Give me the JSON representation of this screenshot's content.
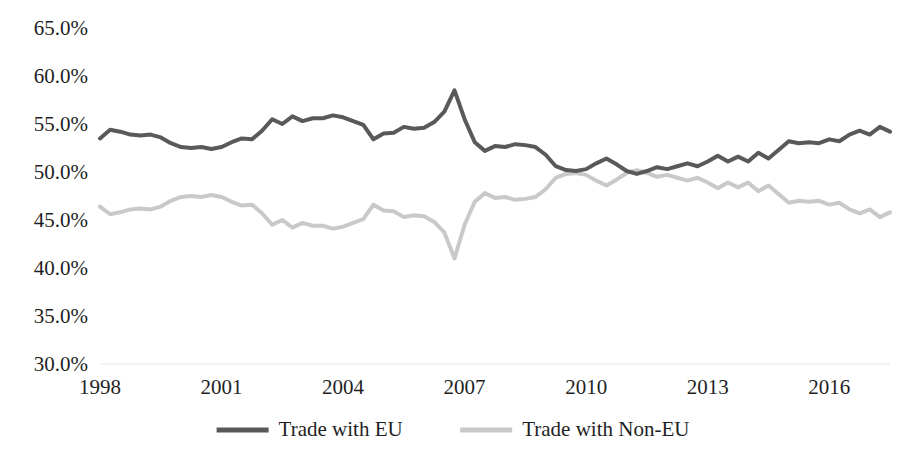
{
  "chart_data": {
    "type": "line",
    "title": "",
    "xlabel": "",
    "ylabel": "",
    "xlim": [
      1998.0,
      2017.5
    ],
    "ylim": [
      30.0,
      65.0
    ],
    "ytick_values": [
      65.0,
      60.0,
      55.0,
      50.0,
      45.0,
      40.0,
      35.0,
      30.0
    ],
    "ytick_labels": [
      "65.0%",
      "60.0%",
      "55.0%",
      "50.0%",
      "45.0%",
      "40.0%",
      "35.0%",
      "30.0%"
    ],
    "xtick_values": [
      1998,
      2001,
      2004,
      2007,
      2010,
      2013,
      2016
    ],
    "xtick_labels": [
      "1998",
      "2001",
      "2004",
      "2007",
      "2010",
      "2013",
      "2016"
    ],
    "grid": "baseline-only",
    "gridline_color": "#e8e8e8",
    "legend_position": "bottom",
    "value_unit": "%",
    "x": [
      1998.0,
      1998.25,
      1998.5,
      1998.75,
      1999.0,
      1999.25,
      1999.5,
      1999.75,
      2000.0,
      2000.25,
      2000.5,
      2000.75,
      2001.0,
      2001.25,
      2001.5,
      2001.75,
      2002.0,
      2002.25,
      2002.5,
      2002.75,
      2003.0,
      2003.25,
      2003.5,
      2003.75,
      2004.0,
      2004.25,
      2004.5,
      2004.75,
      2005.0,
      2005.25,
      2005.5,
      2005.75,
      2006.0,
      2006.25,
      2006.5,
      2006.75,
      2007.0,
      2007.25,
      2007.5,
      2007.75,
      2008.0,
      2008.25,
      2008.5,
      2008.75,
      2009.0,
      2009.25,
      2009.5,
      2009.75,
      2010.0,
      2010.25,
      2010.5,
      2010.75,
      2011.0,
      2011.25,
      2011.5,
      2011.75,
      2012.0,
      2012.25,
      2012.5,
      2012.75,
      2013.0,
      2013.25,
      2013.5,
      2013.75,
      2014.0,
      2014.25,
      2014.5,
      2014.75,
      2015.0,
      2015.25,
      2015.5,
      2015.75,
      2016.0,
      2016.25,
      2016.5,
      2016.75,
      2017.0,
      2017.25,
      2017.5
    ],
    "series": [
      {
        "name": "Trade with EU",
        "color": "#595959",
        "stroke_width": 4,
        "values": [
          53.5,
          54.4,
          54.2,
          53.9,
          53.8,
          53.9,
          53.6,
          53.0,
          52.6,
          52.5,
          52.6,
          52.4,
          52.6,
          53.1,
          53.5,
          53.4,
          54.3,
          55.5,
          55.0,
          55.8,
          55.3,
          55.6,
          55.6,
          55.9,
          55.7,
          55.3,
          54.9,
          53.4,
          54.0,
          54.1,
          54.7,
          54.5,
          54.6,
          55.2,
          56.3,
          58.5,
          55.5,
          53.1,
          52.2,
          52.7,
          52.6,
          52.9,
          52.8,
          52.6,
          51.8,
          50.6,
          50.2,
          50.1,
          50.3,
          50.9,
          51.4,
          50.8,
          50.1,
          49.8,
          50.1,
          50.5,
          50.3,
          50.6,
          50.9,
          50.6,
          51.1,
          51.7,
          51.1,
          51.6,
          51.1,
          52.0,
          51.4,
          52.3,
          53.2,
          53.0,
          53.1,
          53.0,
          53.4,
          53.2,
          53.9,
          54.3,
          53.9,
          54.7,
          54.2
        ]
      },
      {
        "name": "Trade with Non-EU",
        "color": "#c9c9c9",
        "stroke_width": 4,
        "values": [
          46.4,
          45.6,
          45.8,
          46.1,
          46.2,
          46.1,
          46.4,
          47.0,
          47.4,
          47.5,
          47.4,
          47.6,
          47.4,
          46.9,
          46.5,
          46.6,
          45.7,
          44.5,
          45.0,
          44.2,
          44.7,
          44.4,
          44.4,
          44.1,
          44.3,
          44.7,
          45.1,
          46.6,
          46.0,
          45.9,
          45.3,
          45.5,
          45.4,
          44.8,
          43.7,
          41.0,
          44.5,
          46.9,
          47.8,
          47.3,
          47.4,
          47.1,
          47.2,
          47.4,
          48.2,
          49.4,
          49.8,
          49.9,
          49.7,
          49.1,
          48.6,
          49.2,
          49.9,
          50.2,
          49.9,
          49.5,
          49.7,
          49.4,
          49.1,
          49.4,
          48.9,
          48.3,
          48.9,
          48.4,
          48.9,
          48.0,
          48.6,
          47.7,
          46.8,
          47.0,
          46.9,
          47.0,
          46.6,
          46.8,
          46.1,
          45.7,
          46.1,
          45.3,
          45.8
        ]
      }
    ],
    "legend": [
      {
        "label": "Trade with EU",
        "color": "#595959"
      },
      {
        "label": "Trade with Non-EU",
        "color": "#c9c9c9"
      }
    ]
  }
}
